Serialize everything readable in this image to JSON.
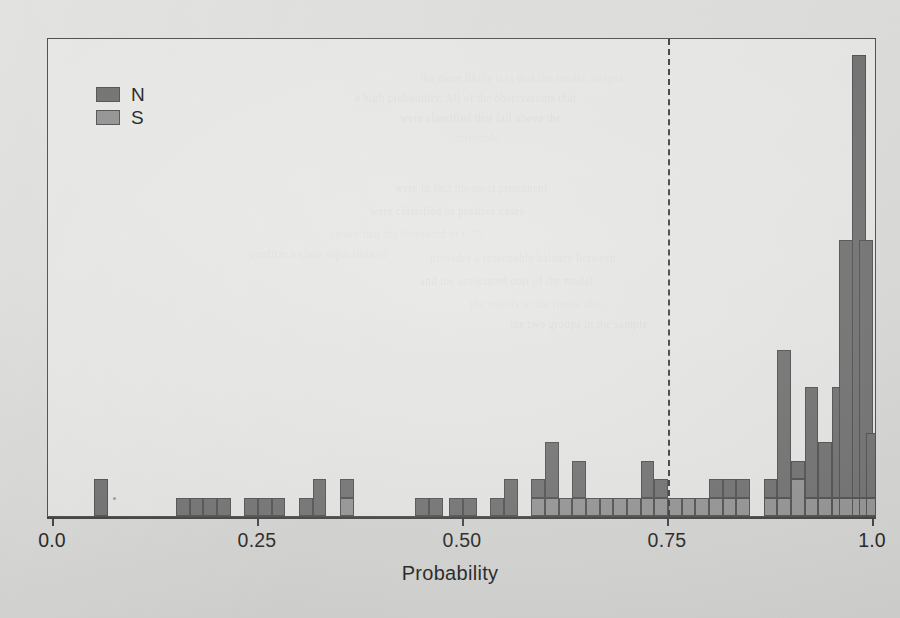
{
  "chart_data": {
    "type": "bar",
    "subtype": "stacked-histogram",
    "title": "",
    "xlabel": "Probability",
    "ylabel": "",
    "xlim": [
      0.0,
      1.0
    ],
    "ylim": [
      0,
      26
    ],
    "grid": false,
    "xticks": [
      0.0,
      0.25,
      0.5,
      0.75,
      1.0
    ],
    "xticklabels": [
      "0.0",
      "0.25",
      "0.50",
      "0.75",
      "1.0"
    ],
    "legend": {
      "position": "top-left",
      "entries": [
        {
          "name": "N",
          "color": "#6e6e6e"
        },
        {
          "name": "S",
          "color": "#919191"
        }
      ]
    },
    "annotations": [
      {
        "type": "vline",
        "x": 0.75,
        "style": "dashed",
        "color": "#3b3b3b"
      }
    ],
    "binwidth": 0.01667,
    "series": [
      {
        "name": "N",
        "color": "#6e6e6e"
      },
      {
        "name": "S",
        "color": "#919191"
      }
    ],
    "bins": [
      {
        "x": 0.0583,
        "N": 2.0,
        "S": 0.0
      },
      {
        "x": 0.1583,
        "N": 1.0,
        "S": 0.0
      },
      {
        "x": 0.175,
        "N": 1.0,
        "S": 0.0
      },
      {
        "x": 0.1917,
        "N": 1.0,
        "S": 0.0
      },
      {
        "x": 0.2083,
        "N": 1.0,
        "S": 0.0
      },
      {
        "x": 0.2417,
        "N": 1.0,
        "S": 0.0
      },
      {
        "x": 0.2583,
        "N": 1.0,
        "S": 0.0
      },
      {
        "x": 0.275,
        "N": 1.0,
        "S": 0.0
      },
      {
        "x": 0.3083,
        "N": 1.0,
        "S": 0.0
      },
      {
        "x": 0.3083,
        "N": 0.0,
        "S": 0.0
      },
      {
        "x": 0.325,
        "N": 2.0,
        "S": 0.0
      },
      {
        "x": 0.3583,
        "N": 1.0,
        "S": 1.0
      },
      {
        "x": 0.45,
        "N": 1.0,
        "S": 0.0
      },
      {
        "x": 0.4667,
        "N": 1.0,
        "S": 0.0
      },
      {
        "x": 0.4917,
        "N": 1.0,
        "S": 0.0
      },
      {
        "x": 0.5083,
        "N": 1.0,
        "S": 0.0
      },
      {
        "x": 0.5417,
        "N": 1.0,
        "S": 0.0
      },
      {
        "x": 0.5583,
        "N": 2.0,
        "S": 0.0
      },
      {
        "x": 0.5917,
        "N": 1.0,
        "S": 1.0
      },
      {
        "x": 0.6083,
        "N": 3.0,
        "S": 1.0
      },
      {
        "x": 0.625,
        "N": 0.0,
        "S": 1.0
      },
      {
        "x": 0.6417,
        "N": 2.0,
        "S": 1.0
      },
      {
        "x": 0.6583,
        "N": 0.0,
        "S": 1.0
      },
      {
        "x": 0.675,
        "N": 0.0,
        "S": 1.0
      },
      {
        "x": 0.6917,
        "N": 0.0,
        "S": 1.0
      },
      {
        "x": 0.7083,
        "N": 0.0,
        "S": 1.0
      },
      {
        "x": 0.725,
        "N": 2.0,
        "S": 1.0
      },
      {
        "x": 0.7417,
        "N": 1.0,
        "S": 1.0
      },
      {
        "x": 0.7583,
        "N": 0.0,
        "S": 1.0
      },
      {
        "x": 0.775,
        "N": 0.0,
        "S": 1.0
      },
      {
        "x": 0.7917,
        "N": 0.0,
        "S": 1.0
      },
      {
        "x": 0.8083,
        "N": 1.0,
        "S": 1.0
      },
      {
        "x": 0.825,
        "N": 1.0,
        "S": 1.0
      },
      {
        "x": 0.8417,
        "N": 1.0,
        "S": 1.0
      },
      {
        "x": 0.875,
        "N": 1.0,
        "S": 1.0
      },
      {
        "x": 0.8917,
        "N": 8.0,
        "S": 1.0
      },
      {
        "x": 0.9083,
        "N": 1.0,
        "S": 2.0
      },
      {
        "x": 0.925,
        "N": 6.0,
        "S": 1.0
      },
      {
        "x": 0.9417,
        "N": 3.0,
        "S": 1.0
      },
      {
        "x": 0.9583,
        "N": 6.0,
        "S": 1.0
      },
      {
        "x": 0.9667,
        "N": 14.0,
        "S": 1.0
      },
      {
        "x": 0.9833,
        "N": 24.0,
        "S": 1.0
      },
      {
        "x": 0.9917,
        "N": 14.0,
        "S": 1.0
      },
      {
        "x": 1.0,
        "N": 3.5,
        "S": 1.0
      }
    ]
  },
  "figure": {
    "legend_items": [
      {
        "label": "N"
      },
      {
        "label": "S"
      }
    ],
    "xlabel": "Probability",
    "xticklabels": [
      "0.0",
      "0.25",
      "0.50",
      "0.75",
      "1.0"
    ]
  },
  "bleed_through_lines": [
    "the more likely it is that the model assigns",
    "a high probability. All of the observations that",
    "were classified that fall above the",
    "threshold",
    "were in fact the most prominent",
    "were classified as positive cases",
    "shows that the threshold of 0.75",
    "provides a reasonable balance between",
    "and the associated cost of the model",
    "the results in the figure also",
    "confirm a clear separation of",
    "the two groups in the sample"
  ]
}
